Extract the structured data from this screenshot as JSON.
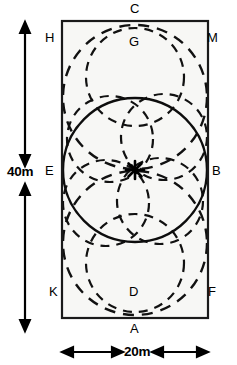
{
  "figure": {
    "type": "geometry-diagram",
    "colors": {
      "stroke": "#000000",
      "fill": "#f7f7f5",
      "background": "#ffffff"
    }
  },
  "dimensions": {
    "width_label": "20m",
    "height_label": "40m"
  },
  "point_labels": {
    "top_outer": "C",
    "bottom_outer": "A",
    "top_left": "H",
    "top_right": "M",
    "mid_left": "E",
    "mid_right": "B",
    "bottom_left": "K",
    "bottom_right": "F",
    "inner_upper": "G",
    "inner_lower": "D"
  },
  "chart_data": {
    "type": "scatter",
    "title": "",
    "xlabel": "20m",
    "ylabel": "40m",
    "rectangle": {
      "x": 62,
      "y": 21,
      "width": 146,
      "height": 297,
      "width_m": 20,
      "height_m": 40
    },
    "center_marker": {
      "x": 135,
      "y": 170,
      "symbol": "asterisk"
    },
    "solid_circles": [
      {
        "cx": 135,
        "cy": 170,
        "r": 72
      }
    ],
    "dashed_circles": [
      {
        "cx": 135,
        "cy": 97,
        "r": 72
      },
      {
        "cx": 135,
        "cy": 243,
        "r": 72
      },
      {
        "cx": 135,
        "cy": 77,
        "r": 49
      },
      {
        "cx": 135,
        "cy": 263,
        "r": 49
      },
      {
        "cx": 106,
        "cy": 203,
        "r": 43
      },
      {
        "cx": 164,
        "cy": 137,
        "r": 43
      },
      {
        "cx": 110,
        "cy": 139,
        "r": 43
      },
      {
        "cx": 160,
        "cy": 201,
        "r": 43
      }
    ]
  }
}
